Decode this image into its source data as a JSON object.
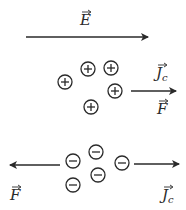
{
  "diagram": {
    "field": {
      "label": "E",
      "x1": 26,
      "x2": 148,
      "y": 37,
      "label_x": 80,
      "label_y": 25
    },
    "positive_group": {
      "charges": [
        {
          "x": 65,
          "y": 82
        },
        {
          "x": 88,
          "y": 69
        },
        {
          "x": 111,
          "y": 68
        },
        {
          "x": 115,
          "y": 91
        },
        {
          "x": 91,
          "y": 107
        }
      ],
      "arrow": {
        "x1": 131,
        "x2": 176,
        "y": 91
      },
      "labels": [
        {
          "text": "J",
          "sub": "c",
          "x": 156,
          "y": 78
        },
        {
          "text": "F",
          "sub": "",
          "x": 157,
          "y": 114
        }
      ]
    },
    "negative_group": {
      "charges": [
        {
          "x": 73,
          "y": 161
        },
        {
          "x": 96,
          "y": 152
        },
        {
          "x": 122,
          "y": 163
        },
        {
          "x": 98,
          "y": 175
        },
        {
          "x": 73,
          "y": 185
        }
      ],
      "left_arrow": {
        "x1": 60,
        "x2": 10,
        "y": 165
      },
      "right_arrow": {
        "x1": 134,
        "x2": 179,
        "y": 164
      },
      "labels": [
        {
          "text": "F",
          "sub": "",
          "x": 10,
          "y": 200
        },
        {
          "text": "J",
          "sub": "c",
          "x": 162,
          "y": 200
        }
      ]
    },
    "color": "#2a2a2a"
  }
}
